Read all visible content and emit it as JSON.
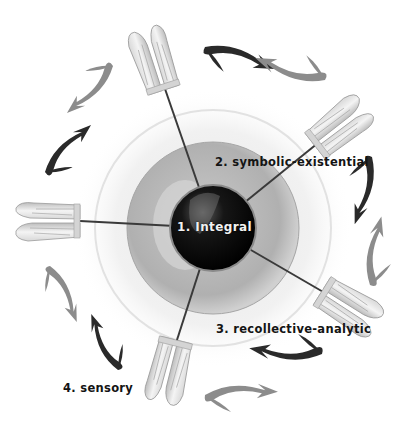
{
  "diagram": {
    "type": "radial-hub-and-spoke",
    "center": {
      "label": "1. Integral",
      "fill": "#0d0d0d"
    },
    "nodes": [
      {
        "id": "top",
        "icon": "hands-pair-icon"
      },
      {
        "id": "upper-right",
        "icon": "hands-pair-icon"
      },
      {
        "id": "left",
        "icon": "hands-pair-icon"
      },
      {
        "id": "lower-right",
        "icon": "hands-pair-icon"
      },
      {
        "id": "bottom",
        "icon": "hands-pair-icon"
      }
    ],
    "labels": {
      "symbolic": "2. symbolic-existential",
      "recollective": "3. recollective-analytic",
      "sensory": "4. sensory"
    },
    "arrow_pairs": [
      {
        "position": "top-right",
        "dark": "#2a2a2a",
        "light": "#8c8c8c"
      },
      {
        "position": "right",
        "dark": "#2a2a2a",
        "light": "#8c8c8c"
      },
      {
        "position": "bottom-right",
        "dark": "#2a2a2a",
        "light": "#8c8c8c"
      },
      {
        "position": "bottom-left",
        "dark": "#2a2a2a",
        "light": "#8c8c8c"
      },
      {
        "position": "upper-left",
        "dark": "#2a2a2a",
        "light": "#8c8c8c"
      }
    ],
    "colors": {
      "halo": "#f0f0f0",
      "disc": "#b8b8b8",
      "sphere": "#0d0d0d",
      "spoke": "#3a3a3a"
    }
  }
}
